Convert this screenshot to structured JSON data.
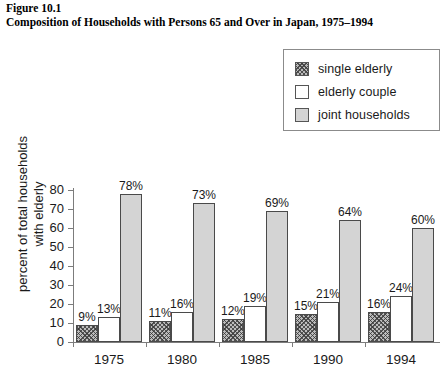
{
  "figure": {
    "number": "Figure 10.1",
    "title": "Composition of Households with Persons 65 and Over in Japan, 1975–1994"
  },
  "legend": {
    "entries": [
      {
        "label": "single elderly",
        "swatch": "hatched",
        "color": "#b9b9b9"
      },
      {
        "label": "elderly couple",
        "swatch": "white",
        "color": "#ffffff"
      },
      {
        "label": "joint households",
        "swatch": "gray",
        "color": "#d4d4d4"
      }
    ]
  },
  "chart_data": {
    "type": "bar",
    "title": "Composition of Households with Persons 65 and Over in Japan, 1975–1994",
    "xlabel": "",
    "ylabel": "percent of total households with elderly",
    "ylabel_lines": [
      "percent of total households",
      "with elderly"
    ],
    "categories": [
      "1975",
      "1980",
      "1985",
      "1990",
      "1994"
    ],
    "series": [
      {
        "name": "single elderly",
        "values": [
          9,
          11,
          12,
          15,
          16
        ],
        "labels": [
          "9%",
          "11%",
          "12%",
          "15%",
          "16%"
        ]
      },
      {
        "name": "elderly couple",
        "values": [
          13,
          16,
          19,
          21,
          24
        ],
        "labels": [
          "13%",
          "16%",
          "19%",
          "21%",
          "24%"
        ]
      },
      {
        "name": "joint households",
        "values": [
          78,
          73,
          69,
          64,
          60
        ],
        "labels": [
          "78%",
          "73%",
          "69%",
          "64%",
          "60%"
        ]
      }
    ],
    "ylim": [
      0,
      80
    ],
    "yticks": [
      0,
      10,
      20,
      30,
      40,
      50,
      60,
      70,
      80
    ],
    "ytick_labels": [
      "0",
      "10",
      "20",
      "30",
      "40",
      "50",
      "60",
      "70",
      "80"
    ],
    "grid": false,
    "legend_position": "top-right",
    "value_labels_shown": true
  }
}
